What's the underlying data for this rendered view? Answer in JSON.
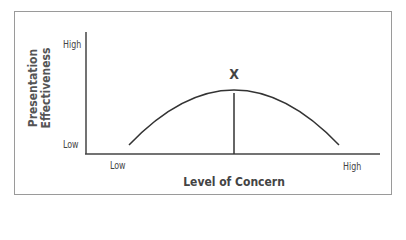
{
  "diagram": {
    "y_axis": {
      "title_line1": "Presentation",
      "title_line2": "Effectiveness",
      "high": "High",
      "low": "Low"
    },
    "x_axis": {
      "title": "Level of Concern",
      "low": "Low",
      "high": "High"
    },
    "peak_marker": "X",
    "colors": {
      "line": "#333333",
      "border": "#9a9a9a"
    }
  }
}
